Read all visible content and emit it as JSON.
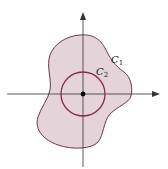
{
  "figure": {
    "type": "diagram",
    "colors": {
      "region_fill": "#e4d3d9",
      "c1_stroke": "#6b3a4a",
      "c2_stroke": "#8b2a45",
      "axis": "#333333",
      "origin_dot": "#000000"
    },
    "labels": {
      "c1": {
        "main": "C",
        "sub": "1"
      },
      "c2": {
        "main": "C",
        "sub": "2"
      }
    },
    "axes": {
      "x_arrow": true,
      "y_arrow": true,
      "origin": [
        83,
        94
      ]
    },
    "circle_c2": {
      "cx": 83,
      "cy": 94,
      "r": 22
    }
  }
}
